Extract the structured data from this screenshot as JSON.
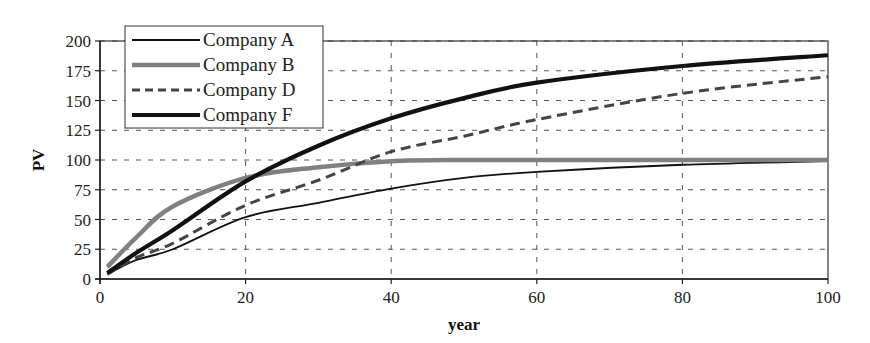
{
  "chart_data": {
    "type": "line",
    "title": "",
    "xlabel": "year",
    "ylabel": "PV",
    "xlim": [
      0,
      100
    ],
    "ylim": [
      0,
      200
    ],
    "x_ticks": [
      0,
      20,
      40,
      60,
      80,
      100
    ],
    "y_ticks": [
      0,
      25,
      50,
      75,
      100,
      125,
      150,
      175,
      200
    ],
    "grid": true,
    "legend_position": "upper left",
    "x": [
      1,
      5,
      10,
      20,
      30,
      40,
      50,
      60,
      80,
      100
    ],
    "series": [
      {
        "name": "Company A",
        "style": "thin-solid",
        "color": "#111111",
        "values": [
          4,
          16,
          25,
          52,
          64,
          76,
          85,
          90,
          96,
          99
        ]
      },
      {
        "name": "Company B",
        "style": "thick-solid-gray",
        "color": "#808080",
        "values": [
          10,
          35,
          61,
          85,
          94,
          99,
          100,
          100,
          100,
          100
        ]
      },
      {
        "name": "Company D",
        "style": "dashed",
        "color": "#444444",
        "values": [
          4,
          18,
          30,
          62,
          83,
          107,
          120,
          134,
          156,
          170
        ]
      },
      {
        "name": "Company F",
        "style": "thick-solid",
        "color": "#111111",
        "values": [
          5,
          22,
          41,
          82,
          112,
          135,
          152,
          165,
          179,
          188
        ]
      }
    ]
  }
}
